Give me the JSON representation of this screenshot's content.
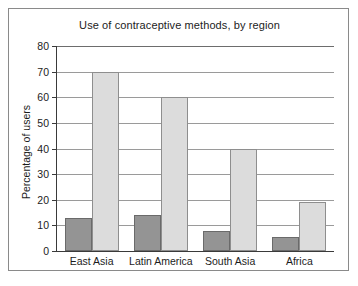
{
  "chart_data": {
    "type": "bar",
    "title": "Use of contraceptive methods, by region",
    "xlabel": "",
    "ylabel": "Percentage of users",
    "categories": [
      "East Asia",
      "Latin America",
      "South Asia",
      "Africa"
    ],
    "series": [
      {
        "name": "1960–65",
        "values": [
          13,
          14,
          8,
          5.5
        ],
        "color": "#949494"
      },
      {
        "name": "1990",
        "values": [
          70,
          60,
          40,
          19
        ],
        "color": "#dcdcdc"
      }
    ],
    "ylim": [
      0,
      80
    ],
    "yticks": [
      0,
      10,
      20,
      30,
      40,
      50,
      60,
      70,
      80
    ],
    "ytick_labels": [
      "0",
      "10",
      "20",
      "30",
      "40",
      "50",
      "60",
      "70",
      "80"
    ],
    "grid": "horizontal",
    "legend_position": "top-center"
  }
}
